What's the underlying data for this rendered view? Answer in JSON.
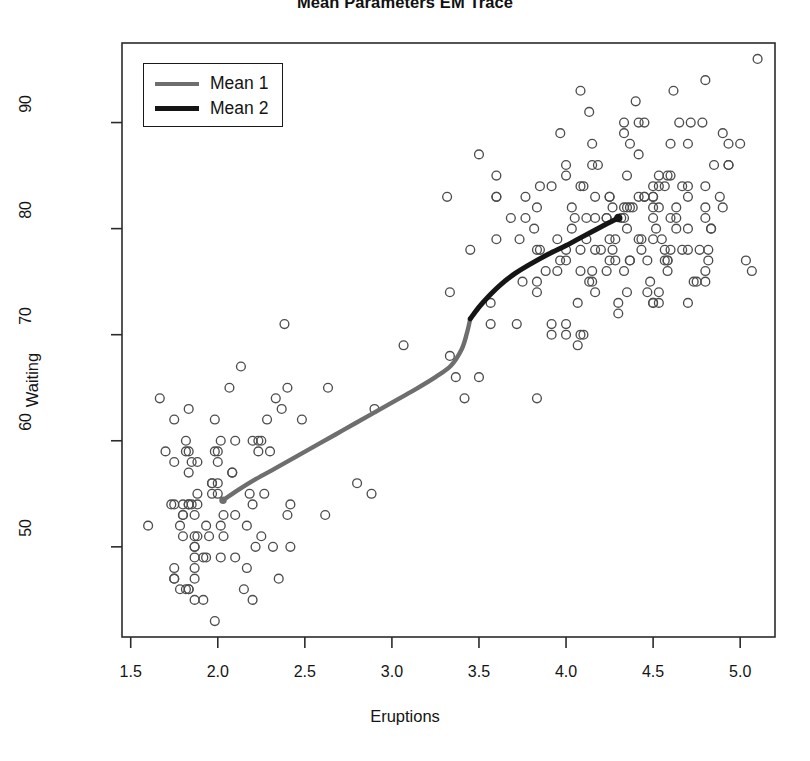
{
  "chart_data": {
    "type": "scatter",
    "title": "Mean Parameters EM Trace",
    "xlabel": "Eruptions",
    "ylabel": "Waiting",
    "xlim": [
      1.45,
      5.2
    ],
    "ylim": [
      41.5,
      97.5
    ],
    "xticks": [
      "1.5",
      "2.0",
      "2.5",
      "3.0",
      "3.5",
      "4.0",
      "4.5",
      "5.0"
    ],
    "xtick_values": [
      1.5,
      2.0,
      2.5,
      3.0,
      3.5,
      4.0,
      4.5,
      5.0
    ],
    "yticks": [
      "50",
      "60",
      "70",
      "80",
      "90"
    ],
    "ytick_values": [
      50,
      60,
      70,
      80,
      90
    ],
    "grid": false,
    "legend_position": "top-left",
    "marker": "open-circle",
    "marker_color": "#4d4d4d",
    "point_count": 272,
    "legend": [
      {
        "label": "Mean 1",
        "color": "#6e6e6e"
      },
      {
        "label": "Mean 2",
        "color": "#151515"
      }
    ],
    "series": [
      {
        "name": "Mean 1",
        "type": "line",
        "color": "#6e6e6e",
        "endpoint_marker": true,
        "endpoint": [
          2.03,
          54.4
        ],
        "points": [
          [
            2.03,
            54.4
          ],
          [
            2.12,
            55.4
          ],
          [
            2.22,
            56.4
          ],
          [
            2.33,
            57.4
          ],
          [
            2.45,
            58.5
          ],
          [
            2.58,
            59.7
          ],
          [
            2.72,
            61.0
          ],
          [
            2.86,
            62.3
          ],
          [
            3.0,
            63.6
          ],
          [
            3.13,
            64.8
          ],
          [
            3.25,
            66.0
          ],
          [
            3.34,
            67.1
          ],
          [
            3.4,
            68.6
          ],
          [
            3.43,
            70.1
          ],
          [
            3.45,
            71.5
          ]
        ]
      },
      {
        "name": "Mean 2",
        "type": "line",
        "color": "#151515",
        "endpoint_marker": true,
        "endpoint": [
          4.3,
          81.0
        ],
        "points": [
          [
            3.45,
            71.5
          ],
          [
            3.5,
            72.6
          ],
          [
            3.56,
            73.7
          ],
          [
            3.63,
            74.8
          ],
          [
            3.71,
            75.8
          ],
          [
            3.8,
            76.7
          ],
          [
            3.9,
            77.6
          ],
          [
            4.0,
            78.4
          ],
          [
            4.09,
            79.2
          ],
          [
            4.17,
            79.9
          ],
          [
            4.24,
            80.5
          ],
          [
            4.3,
            81.0
          ]
        ]
      },
      {
        "name": "Old Faithful observations",
        "type": "scatter",
        "color": "#4d4d4d",
        "points": [
          [
            3.6,
            79
          ],
          [
            1.8,
            54
          ],
          [
            3.333,
            74
          ],
          [
            2.283,
            62
          ],
          [
            4.533,
            85
          ],
          [
            2.883,
            55
          ],
          [
            4.7,
            88
          ],
          [
            3.6,
            85
          ],
          [
            1.95,
            51
          ],
          [
            4.35,
            85
          ],
          [
            1.833,
            54
          ],
          [
            3.917,
            84
          ],
          [
            4.2,
            78
          ],
          [
            1.75,
            47
          ],
          [
            4.7,
            83
          ],
          [
            2.167,
            52
          ],
          [
            1.75,
            62
          ],
          [
            4.8,
            84
          ],
          [
            1.6,
            52
          ],
          [
            4.25,
            79
          ],
          [
            1.8,
            51
          ],
          [
            1.75,
            47
          ],
          [
            3.45,
            78
          ],
          [
            3.067,
            69
          ],
          [
            4.533,
            74
          ],
          [
            3.6,
            83
          ],
          [
            1.967,
            55
          ],
          [
            4.083,
            76
          ],
          [
            3.85,
            78
          ],
          [
            4.433,
            79
          ],
          [
            4.3,
            73
          ],
          [
            4.467,
            77
          ],
          [
            3.367,
            66
          ],
          [
            4.033,
            80
          ],
          [
            3.833,
            74
          ],
          [
            2.017,
            52
          ],
          [
            1.867,
            48
          ],
          [
            4.833,
            80
          ],
          [
            1.833,
            59
          ],
          [
            4.783,
            90
          ],
          [
            4.35,
            80
          ],
          [
            1.883,
            58
          ],
          [
            4.567,
            84
          ],
          [
            1.75,
            58
          ],
          [
            4.533,
            73
          ],
          [
            3.317,
            83
          ],
          [
            3.833,
            64
          ],
          [
            2.1,
            53
          ],
          [
            4.633,
            82
          ],
          [
            2.0,
            59
          ],
          [
            4.8,
            75
          ],
          [
            4.716,
            90
          ],
          [
            1.833,
            54
          ],
          [
            4.833,
            80
          ],
          [
            1.733,
            54
          ],
          [
            4.883,
            83
          ],
          [
            3.717,
            71
          ],
          [
            1.667,
            64
          ],
          [
            4.567,
            77
          ],
          [
            4.317,
            81
          ],
          [
            2.233,
            59
          ],
          [
            4.5,
            84
          ],
          [
            1.75,
            48
          ],
          [
            4.8,
            82
          ],
          [
            1.817,
            60
          ],
          [
            4.4,
            92
          ],
          [
            4.167,
            78
          ],
          [
            4.7,
            78
          ],
          [
            2.067,
            65
          ],
          [
            4.7,
            73
          ],
          [
            4.033,
            82
          ],
          [
            1.967,
            56
          ],
          [
            4.5,
            79
          ],
          [
            4.0,
            71
          ],
          [
            1.983,
            62
          ],
          [
            5.067,
            76
          ],
          [
            2.017,
            60
          ],
          [
            4.567,
            78
          ],
          [
            3.883,
            76
          ],
          [
            3.6,
            83
          ],
          [
            4.133,
            75
          ],
          [
            4.333,
            82
          ],
          [
            4.1,
            70
          ],
          [
            2.633,
            65
          ],
          [
            4.067,
            73
          ],
          [
            4.933,
            88
          ],
          [
            3.95,
            76
          ],
          [
            4.517,
            80
          ],
          [
            2.167,
            48
          ],
          [
            4.0,
            86
          ],
          [
            2.2,
            60
          ],
          [
            4.333,
            90
          ],
          [
            1.867,
            50
          ],
          [
            4.817,
            78
          ],
          [
            1.833,
            63
          ],
          [
            4.3,
            72
          ],
          [
            4.667,
            84
          ],
          [
            3.75,
            75
          ],
          [
            1.867,
            51
          ],
          [
            4.9,
            82
          ],
          [
            2.483,
            62
          ],
          [
            4.367,
            88
          ],
          [
            2.1,
            49
          ],
          [
            4.5,
            83
          ],
          [
            4.05,
            81
          ],
          [
            1.867,
            47
          ],
          [
            4.7,
            84
          ],
          [
            1.783,
            52
          ],
          [
            4.85,
            86
          ],
          [
            3.683,
            81
          ],
          [
            4.733,
            75
          ],
          [
            2.3,
            59
          ],
          [
            4.9,
            89
          ],
          [
            4.417,
            79
          ],
          [
            1.7,
            59
          ],
          [
            4.633,
            81
          ],
          [
            2.317,
            50
          ],
          [
            4.6,
            85
          ],
          [
            1.817,
            59
          ],
          [
            4.417,
            87
          ],
          [
            2.617,
            53
          ],
          [
            4.067,
            69
          ],
          [
            4.25,
            77
          ],
          [
            1.967,
            56
          ],
          [
            4.6,
            88
          ],
          [
            3.767,
            81
          ],
          [
            1.917,
            45
          ],
          [
            4.5,
            82
          ],
          [
            2.267,
            55
          ],
          [
            4.65,
            90
          ],
          [
            1.867,
            45
          ],
          [
            4.167,
            83
          ],
          [
            2.8,
            56
          ],
          [
            4.333,
            89
          ],
          [
            1.833,
            46
          ],
          [
            4.383,
            82
          ],
          [
            1.883,
            51
          ],
          [
            4.933,
            86
          ],
          [
            2.033,
            53
          ],
          [
            3.733,
            79
          ],
          [
            4.233,
            81
          ],
          [
            2.233,
            60
          ],
          [
            4.533,
            82
          ],
          [
            4.817,
            77
          ],
          [
            4.333,
            76
          ],
          [
            1.983,
            59
          ],
          [
            4.633,
            80
          ],
          [
            2.017,
            49
          ],
          [
            5.1,
            96
          ],
          [
            1.8,
            53
          ],
          [
            5.033,
            77
          ],
          [
            4.0,
            77
          ],
          [
            2.4,
            65
          ],
          [
            4.6,
            81
          ],
          [
            3.567,
            71
          ],
          [
            4.0,
            70
          ],
          [
            4.5,
            81
          ],
          [
            4.083,
            93
          ],
          [
            1.8,
            53
          ],
          [
            3.967,
            89
          ],
          [
            2.2,
            45
          ],
          [
            4.15,
            86
          ],
          [
            2.0,
            58
          ],
          [
            3.833,
            78
          ],
          [
            3.5,
            66
          ],
          [
            4.583,
            76
          ],
          [
            2.367,
            63
          ],
          [
            5.0,
            88
          ],
          [
            1.933,
            52
          ],
          [
            4.617,
            93
          ],
          [
            1.917,
            49
          ],
          [
            2.083,
            57
          ],
          [
            4.583,
            77
          ],
          [
            3.333,
            68
          ],
          [
            4.167,
            81
          ],
          [
            4.333,
            81
          ],
          [
            4.5,
            73
          ],
          [
            2.417,
            50
          ],
          [
            4.0,
            85
          ],
          [
            4.167,
            74
          ],
          [
            1.883,
            55
          ],
          [
            4.583,
            77
          ],
          [
            4.25,
            83
          ],
          [
            3.767,
            83
          ],
          [
            2.033,
            51
          ],
          [
            4.433,
            78
          ],
          [
            4.083,
            84
          ],
          [
            1.833,
            46
          ],
          [
            4.417,
            83
          ],
          [
            2.183,
            55
          ],
          [
            4.8,
            81
          ],
          [
            1.833,
            57
          ],
          [
            4.8,
            76
          ],
          [
            4.1,
            84
          ],
          [
            3.966,
            77
          ],
          [
            4.233,
            81
          ],
          [
            3.5,
            87
          ],
          [
            4.366,
            77
          ],
          [
            2.25,
            51
          ],
          [
            4.667,
            78
          ],
          [
            2.1,
            60
          ],
          [
            4.35,
            82
          ],
          [
            4.133,
            91
          ],
          [
            1.867,
            53
          ],
          [
            4.6,
            78
          ],
          [
            1.783,
            46
          ],
          [
            4.367,
            77
          ],
          [
            3.85,
            84
          ],
          [
            1.933,
            49
          ],
          [
            4.5,
            83
          ],
          [
            2.383,
            71
          ],
          [
            4.7,
            80
          ],
          [
            1.867,
            49
          ],
          [
            3.833,
            75
          ],
          [
            3.417,
            64
          ],
          [
            4.233,
            76
          ],
          [
            2.4,
            53
          ],
          [
            4.8,
            94
          ],
          [
            2.0,
            55
          ],
          [
            4.15,
            76
          ],
          [
            1.867,
            50
          ],
          [
            4.267,
            82
          ],
          [
            1.75,
            54
          ],
          [
            4.483,
            75
          ],
          [
            4.0,
            78
          ],
          [
            4.117,
            79
          ],
          [
            4.083,
            78
          ],
          [
            4.267,
            78
          ],
          [
            3.917,
            70
          ],
          [
            4.55,
            79
          ],
          [
            4.083,
            70
          ],
          [
            2.417,
            54
          ],
          [
            4.183,
            86
          ],
          [
            2.217,
            50
          ],
          [
            4.45,
            90
          ],
          [
            1.883,
            54
          ],
          [
            1.85,
            54
          ],
          [
            4.283,
            77
          ],
          [
            3.95,
            79
          ],
          [
            2.333,
            64
          ],
          [
            4.15,
            75
          ],
          [
            2.35,
            47
          ],
          [
            4.933,
            86
          ],
          [
            2.9,
            63
          ],
          [
            4.583,
            85
          ],
          [
            3.833,
            82
          ],
          [
            2.083,
            57
          ],
          [
            4.367,
            82
          ],
          [
            2.133,
            67
          ],
          [
            4.35,
            74
          ],
          [
            2.2,
            54
          ],
          [
            4.45,
            83
          ],
          [
            3.567,
            73
          ],
          [
            4.5,
            73
          ],
          [
            4.15,
            88
          ],
          [
            3.817,
            80
          ],
          [
            3.917,
            71
          ],
          [
            4.45,
            83
          ],
          [
            2.0,
            56
          ],
          [
            4.283,
            79
          ],
          [
            4.767,
            78
          ],
          [
            4.533,
            84
          ],
          [
            1.85,
            58
          ],
          [
            4.25,
            83
          ],
          [
            1.983,
            43
          ],
          [
            2.25,
            60
          ],
          [
            4.75,
            75
          ],
          [
            4.117,
            81
          ],
          [
            2.15,
            46
          ],
          [
            4.417,
            90
          ],
          [
            1.817,
            46
          ],
          [
            4.467,
            74
          ]
        ]
      }
    ]
  }
}
